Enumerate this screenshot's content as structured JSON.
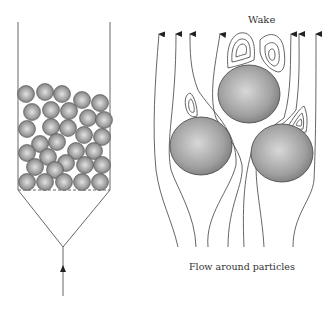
{
  "left_panel": {
    "description": "packed bed in column with conical inlet and upward flow arrow",
    "column": {
      "left_x": 18,
      "right_x": 110,
      "top_y": 22,
      "bed_bottom_y": 190
    },
    "cone_apex": [
      63,
      247
    ],
    "inlet_arrow": {
      "x": 63,
      "from_y": 296,
      "tip_y": 266
    },
    "particles": [
      [
        26,
        94
      ],
      [
        45,
        92
      ],
      [
        62,
        94
      ],
      [
        82,
        100
      ],
      [
        100,
        103
      ],
      [
        32,
        112
      ],
      [
        51,
        110
      ],
      [
        69,
        111
      ],
      [
        88,
        118
      ],
      [
        104,
        120
      ],
      [
        27,
        129
      ],
      [
        51,
        127
      ],
      [
        68,
        128
      ],
      [
        84,
        135
      ],
      [
        102,
        137
      ],
      [
        40,
        144
      ],
      [
        57,
        142
      ],
      [
        76,
        151
      ],
      [
        94,
        151
      ],
      [
        27,
        153
      ],
      [
        48,
        157
      ],
      [
        66,
        163
      ],
      [
        85,
        165
      ],
      [
        102,
        165
      ],
      [
        35,
        167
      ],
      [
        55,
        170
      ],
      [
        27,
        182
      ],
      [
        45,
        182
      ],
      [
        64,
        182
      ],
      [
        82,
        182
      ],
      [
        100,
        182
      ]
    ],
    "particle_radius": 8.5
  },
  "right_panel": {
    "wake_label": "Wake",
    "caption": "Flow around particles",
    "particles": [
      {
        "cx": 249,
        "cy": 94,
        "rx": 31,
        "ry": 29
      },
      {
        "cx": 201,
        "cy": 146,
        "rx": 31,
        "ry": 29
      },
      {
        "cx": 282,
        "cy": 153,
        "rx": 31,
        "ry": 29
      }
    ],
    "streamline_arrow_tips_x": [
      159,
      177,
      190,
      220,
      291,
      299,
      316
    ]
  },
  "colors": {
    "line": "#555555",
    "particle_light": "#e4e4e4",
    "particle_dark": "#6e6e6e"
  }
}
